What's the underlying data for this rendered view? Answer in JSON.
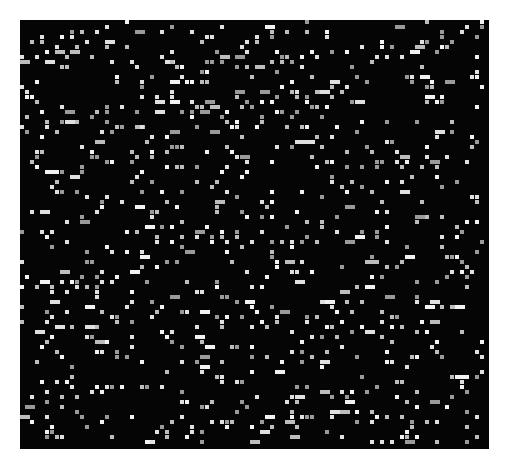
{
  "image": {
    "description": "Black square field filled with randomly scattered small white and gray square dots (cellular noise pattern)",
    "background": "#ffffff",
    "field": {
      "x": 20,
      "y": 20,
      "width": 469,
      "height": 429,
      "color": "#050505"
    },
    "grid": {
      "cell": 5,
      "pitch": 5
    },
    "dots": {
      "density": 0.11,
      "colors": [
        "#f2f2f2",
        "#e0e0e0",
        "#bdbdbd",
        "#9a9a9a"
      ],
      "seed": 1337
    }
  }
}
